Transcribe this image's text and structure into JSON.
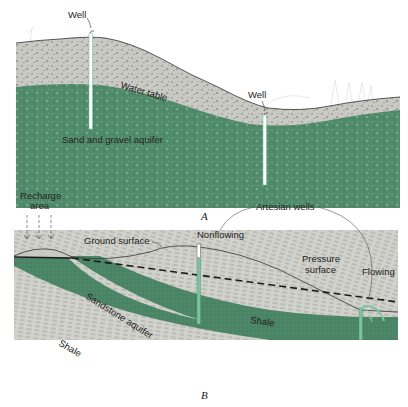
{
  "panel_a": {
    "caption": "A",
    "labels": {
      "well_left": "Well",
      "well_right": "Well",
      "water_table": "Water table",
      "aquifer": "Sand and gravel aquifer"
    }
  },
  "panel_b": {
    "caption": "B",
    "labels": {
      "recharge_line1": "Recharge",
      "recharge_line2": "area",
      "ground_surface": "Ground surface",
      "artesian_wells": "Artesian wells",
      "nonflowing": "Nonflowing",
      "pressure_line1": "Pressure",
      "pressure_line2": "surface",
      "flowing": "Flowing",
      "sandstone_aquifer": "Sandstone aquifer",
      "shale_upper": "Shale",
      "shale_lower": "Shale"
    }
  },
  "colors": {
    "aquifer_green": "#4f8a6a",
    "unsaturated_gray": "#c9c9c4",
    "shale_gray": "#cfcfca",
    "well_green": "#7cc4a0"
  }
}
